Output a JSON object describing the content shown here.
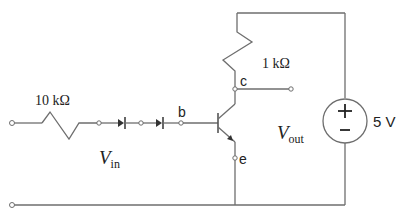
{
  "diagram": {
    "type": "circuit-schematic",
    "components": {
      "input_resistor": {
        "label": "10 kΩ"
      },
      "collector_resistor": {
        "label": "1 kΩ"
      },
      "supply": {
        "label": "5 V",
        "plus": "+",
        "minus": "–"
      },
      "diodes": {
        "count": 2
      },
      "transistor": {
        "type": "NPN"
      }
    },
    "terminals": {
      "base": "b",
      "collector": "c",
      "emitter": "e"
    },
    "voltages": {
      "input": {
        "main": "V",
        "sub": "in"
      },
      "output": {
        "main": "V",
        "sub": "out"
      }
    },
    "colors": {
      "wire": "#6e6e6e",
      "text": "#222222",
      "background": "#ffffff"
    }
  }
}
